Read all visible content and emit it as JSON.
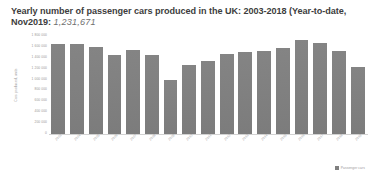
{
  "chart_data": {
    "type": "bar",
    "title": "Yearly number of passenger cars produced in the UK: 2003-2018 (Year-to-date, Nov2019:",
    "title_line1": "Yearly number of passenger cars produced in the UK: 2003-2018 (Year-to-date,",
    "title_line2_prefix": "Nov2019:",
    "title_figure": "1,231,671",
    "subtitle": "",
    "xlabel": "",
    "ylabel": "Cars produced, units",
    "categories": [
      "2003",
      "2004",
      "2005",
      "2006",
      "2007",
      "2008",
      "2009",
      "2010",
      "2011",
      "2012",
      "2013",
      "2014",
      "2015",
      "2016",
      "2017",
      "2018",
      "2019"
    ],
    "values": [
      1657558,
      1647221,
      1596356,
      1442085,
      1534567,
      1446619,
      999460,
      1270444,
      1343810,
      1464906,
      1509762,
      1528148,
      1587677,
      1722698,
      1671166,
      1519440,
      1231671
    ],
    "ylim": [
      0,
      1800000
    ],
    "yticks": [
      0,
      200000,
      400000,
      600000,
      800000,
      1000000,
      1200000,
      1400000,
      1600000,
      1800000
    ],
    "ytick_labels": [
      "0",
      "200 000",
      "400 000",
      "600 000",
      "800 000",
      "1 000 000",
      "1 200 000",
      "1 400 000",
      "1 600 000",
      "1 800 000"
    ],
    "grid": false,
    "legend_position": "bottom-right",
    "legend": [
      {
        "label": "Passenger cars",
        "color": "#808080"
      }
    ],
    "series": [
      {
        "name": "Passenger cars",
        "color": "#808080"
      }
    ],
    "bar_color": "#808080",
    "background": "#ffffff"
  }
}
